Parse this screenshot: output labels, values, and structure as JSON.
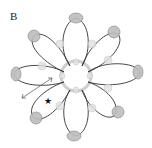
{
  "figure": {
    "panel_label": "B",
    "colors": {
      "strand": "#333333",
      "bead_fill": "#bdbdbd",
      "bead_stroke": "#777777",
      "inner_bead": "#d6d6d6",
      "star": "#111111"
    },
    "loop_count": 8,
    "markers": {
      "star_symbol": "★",
      "arrow": "double-headed arrow"
    }
  }
}
